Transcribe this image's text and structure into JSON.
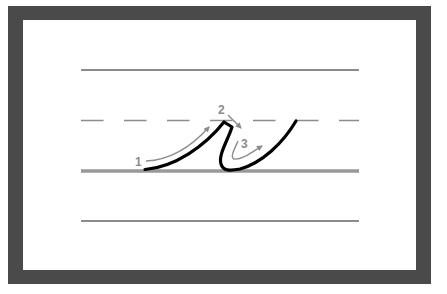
{
  "diagram": {
    "letter": "r",
    "colors": {
      "frame": "#4a4a4a",
      "paper": "#ffffff",
      "guide_line": "#8c8c8c",
      "baseline": "#999999",
      "stroke": "#000000",
      "arrow": "#8c8c8c"
    },
    "guide_lines": [
      {
        "name": "top-line",
        "style": "solid"
      },
      {
        "name": "midline",
        "style": "dashed"
      },
      {
        "name": "baseline",
        "style": "solid-thick"
      },
      {
        "name": "descender-line",
        "style": "solid"
      }
    ],
    "steps": [
      {
        "number": "1",
        "description": "Upward curve from baseline to midline"
      },
      {
        "number": "2",
        "description": "Short slant down-right at peak"
      },
      {
        "number": "3",
        "description": "Down to baseline and curve up to exit"
      }
    ]
  }
}
